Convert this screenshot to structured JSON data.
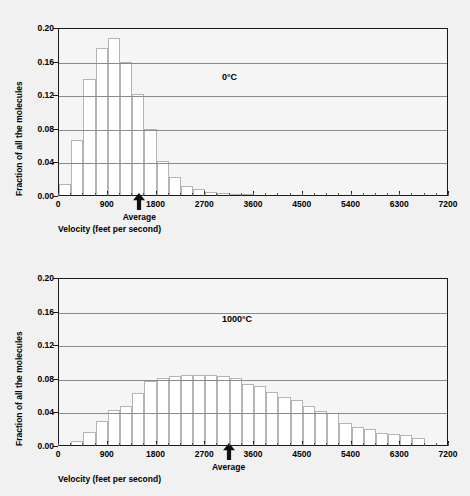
{
  "figure": {
    "background_color": "#f1f1f1",
    "plot_background_color": "#f5f5f5",
    "axis_color": "#1a1a1a",
    "grid_color": "#8a8a8a",
    "bar_fill_color": "#ffffff",
    "bar_edge_color": "#b4b4b4"
  },
  "chart_data": [
    {
      "type": "bar",
      "id": "chart-0c",
      "title": "",
      "annotation": "0°C",
      "xlabel": "Velocity (feet per second)",
      "ylabel": "Fraction of all the molecules",
      "xlim": [
        0,
        7200
      ],
      "ylim": [
        0.0,
        0.2
      ],
      "xticks": [
        0,
        900,
        1800,
        2700,
        3600,
        4500,
        5400,
        6300,
        7200
      ],
      "xtick_labels": [
        "0",
        "900",
        "1800",
        "2700",
        "3600",
        "4500",
        "5400",
        "6300",
        "7200"
      ],
      "yticks": [
        0.0,
        0.04,
        0.08,
        0.12,
        0.16,
        0.2
      ],
      "ytick_labels": [
        "0.00",
        "0.04",
        "0.08",
        "0.12",
        "0.16",
        "0.20"
      ],
      "grid": "horizontal",
      "bin_width": 225,
      "bin_starts": [
        0,
        225,
        450,
        675,
        900,
        1125,
        1350,
        1575,
        1800,
        2025,
        2250,
        2475,
        2700,
        2925,
        3150,
        3375,
        3600
      ],
      "values": [
        0.013,
        0.065,
        0.138,
        0.175,
        0.187,
        0.158,
        0.12,
        0.079,
        0.04,
        0.021,
        0.011,
        0.007,
        0.004,
        0.002,
        0.001,
        0.001,
        0.0
      ],
      "marker": {
        "label": "Average",
        "x": 1500
      }
    },
    {
      "type": "bar",
      "id": "chart-1000c",
      "title": "",
      "annotation": "1000°C",
      "xlabel": "Velocity (feet per second)",
      "ylabel": "Fraction of all the molecules",
      "xlim": [
        0,
        7200
      ],
      "ylim": [
        0.0,
        0.2
      ],
      "xticks": [
        0,
        900,
        1800,
        2700,
        3600,
        4500,
        5400,
        6300,
        7200
      ],
      "xtick_labels": [
        "0",
        "900",
        "1800",
        "2700",
        "3600",
        "4500",
        "5400",
        "6300",
        "7200"
      ],
      "yticks": [
        0.0,
        0.04,
        0.08,
        0.12,
        0.16,
        0.2
      ],
      "ytick_labels": [
        "0.00",
        "0.04",
        "0.08",
        "0.12",
        "0.16",
        "0.20"
      ],
      "grid": "horizontal",
      "bin_width": 225,
      "bin_starts": [
        225,
        450,
        675,
        900,
        1125,
        1350,
        1575,
        1800,
        2025,
        2250,
        2475,
        2700,
        2925,
        3150,
        3375,
        3600,
        3825,
        4050,
        4275,
        4500,
        4725,
        4950,
        5175,
        5400,
        5625,
        5850,
        6075,
        6300,
        6525
      ],
      "values": [
        0.005,
        0.016,
        0.029,
        0.042,
        0.046,
        0.062,
        0.076,
        0.08,
        0.082,
        0.083,
        0.083,
        0.083,
        0.082,
        0.08,
        0.073,
        0.07,
        0.063,
        0.057,
        0.053,
        0.046,
        0.04,
        0.038,
        0.026,
        0.022,
        0.019,
        0.014,
        0.013,
        0.012,
        0.008
      ],
      "marker": {
        "label": "Average",
        "x": 3150
      }
    }
  ]
}
